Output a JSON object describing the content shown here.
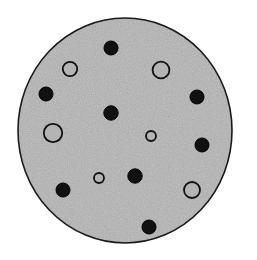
{
  "figure": {
    "canvas": {
      "width": 257,
      "height": 260,
      "background_color": "#ffffff"
    },
    "disc": {
      "name": "disc",
      "center_x": 125,
      "center_y": 130.5,
      "radius_x": 107,
      "radius_y": 112.5,
      "fill_color": "#a8a8a8",
      "speckle_light_color": "#c8c8c8",
      "speckle_dark_color": "#8a8a8a",
      "outline_color": "#1a1a1a",
      "outline_width": 1.6
    },
    "marker_styles": {
      "filled": {
        "label": "filled marker",
        "fill_color": "#111111",
        "stroke_color": "#000000",
        "stroke_width": 1
      },
      "open": {
        "label": "open marker",
        "fill_color": "#b4b4b4",
        "stroke_color": "#111111",
        "stroke_width": 1.8
      }
    },
    "counts": {
      "filled_markers": 8,
      "open_markers": 6,
      "total_markers": 14
    },
    "markers": [
      {
        "id": "m01",
        "type": "filled",
        "cx": 111,
        "cy": 48,
        "r": 7.0
      },
      {
        "id": "m02",
        "type": "open",
        "cx": 70,
        "cy": 69,
        "r": 7.2
      },
      {
        "id": "m03",
        "type": "open",
        "cx": 161,
        "cy": 70,
        "r": 8.4
      },
      {
        "id": "m04",
        "type": "filled",
        "cx": 46,
        "cy": 94,
        "r": 7.0
      },
      {
        "id": "m05",
        "type": "filled",
        "cx": 197,
        "cy": 97,
        "r": 7.0
      },
      {
        "id": "m06",
        "type": "filled",
        "cx": 111,
        "cy": 113,
        "r": 7.2
      },
      {
        "id": "m07",
        "type": "open",
        "cx": 53,
        "cy": 133,
        "r": 9.2
      },
      {
        "id": "m08",
        "type": "open",
        "cx": 151,
        "cy": 136,
        "r": 5.0
      },
      {
        "id": "m09",
        "type": "filled",
        "cx": 202,
        "cy": 145,
        "r": 7.0
      },
      {
        "id": "m10",
        "type": "open",
        "cx": 99,
        "cy": 178,
        "r": 5.0
      },
      {
        "id": "m11",
        "type": "filled",
        "cx": 135,
        "cy": 176,
        "r": 7.2
      },
      {
        "id": "m12",
        "type": "filled",
        "cx": 63,
        "cy": 190,
        "r": 7.0
      },
      {
        "id": "m13",
        "type": "open",
        "cx": 192,
        "cy": 190,
        "r": 8.0
      },
      {
        "id": "m14",
        "type": "filled",
        "cx": 149,
        "cy": 227,
        "r": 7.0
      }
    ]
  }
}
